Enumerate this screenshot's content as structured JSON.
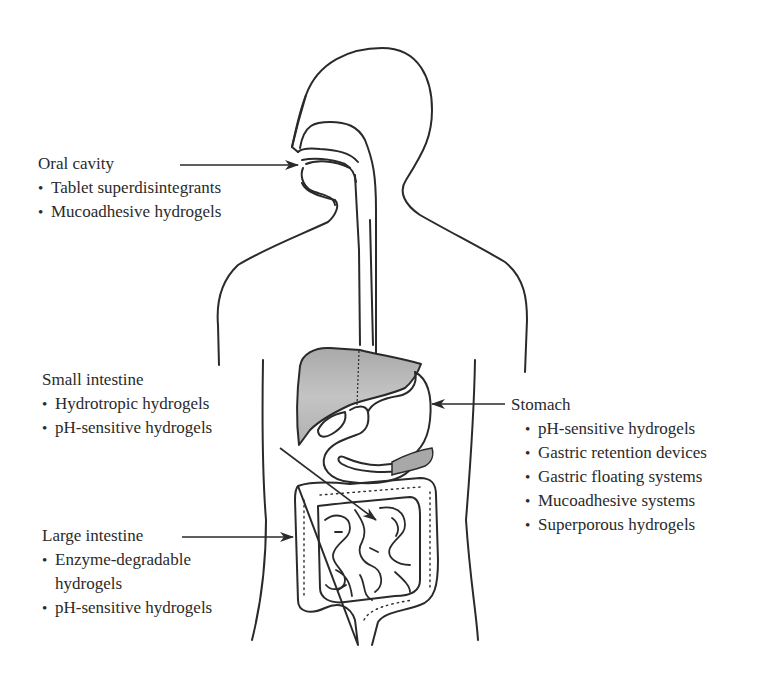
{
  "figure": {
    "type": "anatomical-diagram",
    "colors": {
      "outline": "#2a2a2a",
      "liver_fill": "#b5b5b5",
      "pancreas_fill": "#a8a8a8",
      "background": "#ffffff"
    }
  },
  "labels": {
    "oral_cavity": {
      "title": "Oral cavity",
      "items": [
        "Tablet superdisintegrants",
        "Mucoadhesive hydrogels"
      ]
    },
    "small_intestine": {
      "title": "Small intestine",
      "items": [
        "Hydrotropic hydrogels",
        "pH-sensitive hydrogels"
      ]
    },
    "large_intestine": {
      "title": "Large intestine",
      "items": [
        {
          "line1": "Enzyme-degradable",
          "line2": "hydrogels"
        },
        "pH-sensitive hydrogels"
      ]
    },
    "stomach": {
      "title": "Stomach",
      "items": [
        "pH-sensitive hydrogels",
        "Gastric retention devices",
        "Gastric floating systems",
        "Mucoadhesive systems",
        "Superporous hydrogels"
      ]
    }
  }
}
